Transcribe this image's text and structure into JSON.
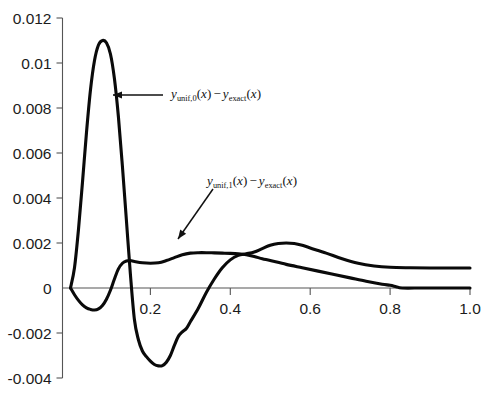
{
  "chart_data": {
    "type": "line",
    "title": "",
    "xlabel": "",
    "ylabel": "",
    "xlim": [
      -0.02,
      1.0
    ],
    "ylim": [
      -0.004,
      0.012
    ],
    "grid": false,
    "legend_position": "inline-annotations",
    "xticks": [
      0.2,
      0.4,
      0.6,
      0.8,
      1.0
    ],
    "xtick_labels": [
      "0.2",
      "0.4",
      "0.6",
      "0.8",
      "1.0"
    ],
    "yticks": [
      -0.004,
      -0.002,
      0,
      0.002,
      0.004,
      0.006,
      0.008,
      0.01,
      0.012
    ],
    "ytick_labels": [
      "-0.004",
      "-0.002",
      "0",
      "0.002",
      "0.004",
      "0.006",
      "0.008",
      "0.01",
      "0.012"
    ],
    "series": [
      {
        "name": "y_unif,0(x) - y_exact(x)",
        "color": "#0a0a0a",
        "points": [
          [
            0.0,
            0.0
          ],
          [
            0.01,
            0.0009
          ],
          [
            0.02,
            0.0026
          ],
          [
            0.03,
            0.0047
          ],
          [
            0.04,
            0.0069
          ],
          [
            0.05,
            0.0088
          ],
          [
            0.06,
            0.0101
          ],
          [
            0.07,
            0.0108
          ],
          [
            0.08,
            0.011
          ],
          [
            0.09,
            0.0109
          ],
          [
            0.1,
            0.0104
          ],
          [
            0.11,
            0.0093
          ],
          [
            0.12,
            0.0076
          ],
          [
            0.13,
            0.0054
          ],
          [
            0.14,
            0.003
          ],
          [
            0.15,
            0.0006
          ],
          [
            0.16,
            -0.0014
          ],
          [
            0.17,
            -0.0023
          ],
          [
            0.18,
            -0.0028
          ],
          [
            0.19,
            -0.00305
          ],
          [
            0.2,
            -0.00325
          ],
          [
            0.21,
            -0.0034
          ],
          [
            0.22,
            -0.00346
          ],
          [
            0.23,
            -0.00345
          ],
          [
            0.24,
            -0.0033
          ],
          [
            0.25,
            -0.003
          ],
          [
            0.26,
            -0.00255
          ],
          [
            0.27,
            -0.00215
          ],
          [
            0.28,
            -0.00195
          ],
          [
            0.29,
            -0.0018
          ],
          [
            0.3,
            -0.0015
          ],
          [
            0.32,
            -0.0009
          ],
          [
            0.34,
            -0.0002
          ],
          [
            0.36,
            0.0004
          ],
          [
            0.38,
            0.0009
          ],
          [
            0.4,
            0.00125
          ],
          [
            0.42,
            0.00145
          ],
          [
            0.44,
            0.00152
          ],
          [
            0.46,
            0.0016
          ],
          [
            0.48,
            0.00175
          ],
          [
            0.5,
            0.0019
          ],
          [
            0.52,
            0.00198
          ],
          [
            0.54,
            0.002
          ],
          [
            0.56,
            0.00198
          ],
          [
            0.58,
            0.0019
          ],
          [
            0.6,
            0.00178
          ],
          [
            0.64,
            0.00155
          ],
          [
            0.68,
            0.0013
          ],
          [
            0.72,
            0.0011
          ],
          [
            0.76,
            0.00098
          ],
          [
            0.8,
            0.00092
          ],
          [
            0.85,
            0.0009
          ],
          [
            0.9,
            0.00089
          ],
          [
            0.95,
            0.00089
          ],
          [
            1.0,
            0.00089
          ]
        ]
      },
      {
        "name": "y_unif,1(x) - y_exact(x)",
        "color": "#0a0a0a",
        "points": [
          [
            0.0,
            0.0
          ],
          [
            0.01,
            -0.0003
          ],
          [
            0.02,
            -0.00055
          ],
          [
            0.03,
            -0.00075
          ],
          [
            0.04,
            -0.00088
          ],
          [
            0.05,
            -0.00095
          ],
          [
            0.06,
            -0.00098
          ],
          [
            0.07,
            -0.00093
          ],
          [
            0.08,
            -0.00078
          ],
          [
            0.09,
            -0.0005
          ],
          [
            0.1,
            -0.0001
          ],
          [
            0.11,
            0.0004
          ],
          [
            0.12,
            0.00085
          ],
          [
            0.13,
            0.0011
          ],
          [
            0.14,
            0.0012
          ],
          [
            0.15,
            0.00122
          ],
          [
            0.16,
            0.00118
          ],
          [
            0.18,
            0.00112
          ],
          [
            0.2,
            0.0011
          ],
          [
            0.22,
            0.00112
          ],
          [
            0.24,
            0.00122
          ],
          [
            0.26,
            0.00135
          ],
          [
            0.28,
            0.00148
          ],
          [
            0.3,
            0.00155
          ],
          [
            0.32,
            0.00157
          ],
          [
            0.34,
            0.00157
          ],
          [
            0.36,
            0.00156
          ],
          [
            0.38,
            0.00155
          ],
          [
            0.4,
            0.00154
          ],
          [
            0.42,
            0.00152
          ],
          [
            0.44,
            0.00148
          ],
          [
            0.46,
            0.0014
          ],
          [
            0.48,
            0.0013
          ],
          [
            0.5,
            0.00122
          ],
          [
            0.54,
            0.00105
          ],
          [
            0.58,
            0.0009
          ],
          [
            0.62,
            0.00075
          ],
          [
            0.66,
            0.0006
          ],
          [
            0.7,
            0.00045
          ],
          [
            0.74,
            0.0003
          ],
          [
            0.78,
            0.00017
          ],
          [
            0.8,
            0.00012
          ],
          [
            0.815,
            6e-05
          ],
          [
            0.83,
            0.0
          ],
          [
            0.88,
            0.0
          ],
          [
            0.94,
            0.0
          ],
          [
            1.0,
            0.0
          ]
        ]
      }
    ],
    "annotations": [
      {
        "id": "annot-curve-0",
        "y_symbol": "y",
        "sub1": "unif,0",
        "arg1": "(x)",
        "minus": "−",
        "y_symbol2": "y",
        "sub2": "exact",
        "arg2": "(x)",
        "text_plain": "y_unif,0(x) − y_exact(x)",
        "arrow_from_x": 163,
        "arrow_from_y": 95,
        "arrow_to_x": 113,
        "arrow_to_y": 95
      },
      {
        "id": "annot-curve-1",
        "y_symbol": "y",
        "sub1": "unif,1",
        "arg1": "(x)",
        "minus": "−",
        "y_symbol2": "y",
        "sub2": "exact",
        "arg2": "(x)",
        "text_plain": "y_unif,1(x) − y_exact(x)",
        "arrow_from_x": 213,
        "arrow_from_y": 189,
        "arrow_to_x": 178,
        "arrow_to_y": 239
      }
    ]
  }
}
